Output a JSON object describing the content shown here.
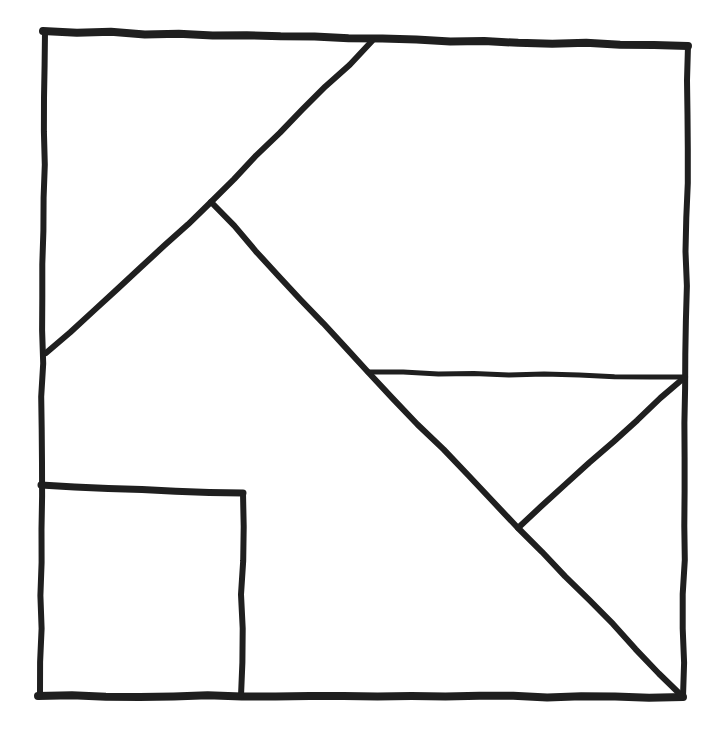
{
  "canvas": {
    "width": 720,
    "height": 734,
    "background": "#ffffff",
    "ink": "#1f1f1f"
  },
  "figure": {
    "kind": "hand-drawn square dissection puzzle",
    "jitter_amplitude": 1.1,
    "shapes": [
      {
        "name": "outer-square-top-edge",
        "stroke_width": 8,
        "points": [
          [
            43,
            31
          ],
          [
            688,
            46
          ]
        ]
      },
      {
        "name": "outer-square-right-edge",
        "stroke_width": 6,
        "points": [
          [
            688,
            46
          ],
          [
            683,
            697
          ]
        ]
      },
      {
        "name": "outer-square-bottom-edge",
        "stroke_width": 8,
        "points": [
          [
            683,
            697
          ],
          [
            38,
            696
          ]
        ]
      },
      {
        "name": "outer-square-left-edge",
        "stroke_width": 6,
        "points": [
          [
            45,
            32
          ],
          [
            40,
            695
          ]
        ]
      },
      {
        "name": "cut-top-edge-to-left-edge-diagonal",
        "stroke_width": 6,
        "points": [
          [
            372,
            41
          ],
          [
            211,
            202
          ],
          [
            46,
            353
          ]
        ]
      },
      {
        "name": "cut-long-diagonal-to-bottom-right",
        "stroke_width": 6,
        "points": [
          [
            211,
            202
          ],
          [
            368,
            372
          ],
          [
            518,
            528
          ],
          [
            683,
            697
          ]
        ]
      },
      {
        "name": "cut-horizontal-to-right-edge",
        "stroke_width": 5,
        "points": [
          [
            368,
            372
          ],
          [
            685,
            377
          ]
        ]
      },
      {
        "name": "cut-right-notch-diagonal",
        "stroke_width": 6,
        "points": [
          [
            685,
            377
          ],
          [
            518,
            528
          ]
        ]
      },
      {
        "name": "small-square-top-edge",
        "stroke_width": 7,
        "points": [
          [
            41,
            485
          ],
          [
            243,
            493
          ]
        ]
      },
      {
        "name": "small-square-right-edge",
        "stroke_width": 6,
        "points": [
          [
            243,
            493
          ],
          [
            241,
            696
          ]
        ]
      }
    ]
  }
}
